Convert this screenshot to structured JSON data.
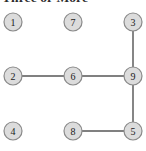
{
  "figure": {
    "title": "Three or More",
    "colors": {
      "background": "#ffffff",
      "node_fill": "#dcdcdc",
      "node_stroke": "#8a8a8a",
      "edge": "#808080",
      "label": "#1a1a1a",
      "title": "#2b2b2b"
    }
  },
  "graph": {
    "node_radius": 9,
    "nodes": [
      {
        "id": "1",
        "label": "1",
        "cx": 13,
        "cy": 22,
        "row": 0,
        "col": 0
      },
      {
        "id": "7",
        "label": "7",
        "cx": 73,
        "cy": 22,
        "row": 0,
        "col": 1
      },
      {
        "id": "3",
        "label": "3",
        "cx": 133,
        "cy": 22,
        "row": 0,
        "col": 2
      },
      {
        "id": "2",
        "label": "2",
        "cx": 13,
        "cy": 76,
        "row": 1,
        "col": 0
      },
      {
        "id": "6",
        "label": "6",
        "cx": 73,
        "cy": 76,
        "row": 1,
        "col": 1
      },
      {
        "id": "9",
        "label": "9",
        "cx": 133,
        "cy": 76,
        "row": 1,
        "col": 2
      },
      {
        "id": "4",
        "label": "4",
        "cx": 13,
        "cy": 131,
        "row": 2,
        "col": 0
      },
      {
        "id": "8",
        "label": "8",
        "cx": 73,
        "cy": 131,
        "row": 2,
        "col": 1
      },
      {
        "id": "5",
        "label": "5",
        "cx": 133,
        "cy": 131,
        "row": 2,
        "col": 2
      }
    ],
    "edges": [
      {
        "from": "3",
        "to": "9",
        "x1": 133,
        "y1": 31,
        "x2": 133,
        "y2": 67
      },
      {
        "from": "2",
        "to": "6",
        "x1": 22,
        "y1": 76,
        "x2": 64,
        "y2": 76
      },
      {
        "from": "6",
        "to": "9",
        "x1": 82,
        "y1": 76,
        "x2": 124,
        "y2": 76
      },
      {
        "from": "9",
        "to": "5",
        "x1": 133,
        "y1": 85,
        "x2": 133,
        "y2": 122
      },
      {
        "from": "8",
        "to": "5",
        "x1": 82,
        "y1": 131,
        "x2": 124,
        "y2": 131
      }
    ]
  }
}
